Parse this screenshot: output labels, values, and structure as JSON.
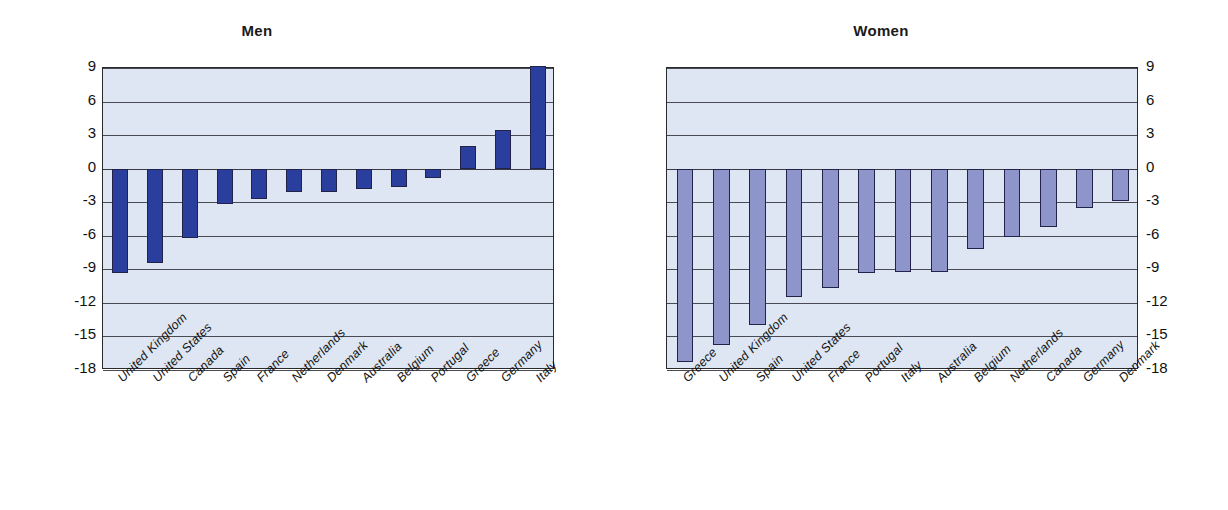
{
  "figure": {
    "background": "#ffffff",
    "plot_background": "#dde6f2",
    "men_bar_color": "#2a3f9d",
    "women_bar_color": "#8e95ca",
    "gridline_color": "#4a4a55"
  },
  "panels": [
    {
      "title": "Men"
    },
    {
      "title": "Women"
    }
  ],
  "axis": {
    "ticks": [
      "9",
      "6",
      "3",
      "0",
      "-3",
      "-6",
      "-9",
      "-12",
      "-15",
      "-18"
    ],
    "min": -18,
    "max": 9,
    "step": 3
  },
  "chart_data": [
    {
      "type": "bar",
      "title": "Men",
      "xlabel": "",
      "ylabel": "",
      "ylim": [
        -18,
        9
      ],
      "yticks": [
        9,
        6,
        3,
        0,
        -3,
        -6,
        -9,
        -12,
        -15,
        -18
      ],
      "grid": true,
      "legend": "none",
      "orientation": "vertical",
      "categories": [
        "United Kingdom",
        "United States",
        "Canada",
        "Spain",
        "France",
        "Netherlands",
        "Denmark",
        "Australia",
        "Belgium",
        "Portugal",
        "Greece",
        "Germany",
        "Italy"
      ],
      "values": [
        -9.3,
        -8.4,
        -6.2,
        -3.2,
        -2.7,
        -2.1,
        -2.1,
        -1.8,
        -1.6,
        -0.8,
        2.0,
        3.5,
        9.2
      ]
    },
    {
      "type": "bar",
      "title": "Women",
      "xlabel": "",
      "ylabel": "",
      "ylim": [
        -18,
        9
      ],
      "yticks": [
        9,
        6,
        3,
        0,
        -3,
        -6,
        -9,
        -12,
        -15,
        -18
      ],
      "grid": true,
      "legend": "none",
      "orientation": "vertical",
      "categories": [
        "Greece",
        "United Kingdom",
        "Spain",
        "United States",
        "France",
        "Portugal",
        "Italy",
        "Australia",
        "Belgium",
        "Netherlands",
        "Canada",
        "Germany",
        "Denmark"
      ],
      "values": [
        -17.3,
        -15.8,
        -14.0,
        -11.5,
        -10.7,
        -9.3,
        -9.2,
        -9.2,
        -7.2,
        -6.1,
        -5.2,
        -3.5,
        -2.9
      ]
    }
  ]
}
